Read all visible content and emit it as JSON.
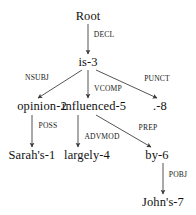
{
  "diagram": {
    "background_color": "#ffffff",
    "line_color": "#555555",
    "text_color": "#111111",
    "sentence": "Sarah's opinion is largely influenced by John's .",
    "nodes": [
      {
        "id": "root",
        "label": "Root",
        "x": 88,
        "y": 16,
        "token_index": null
      },
      {
        "id": "is",
        "label": "is-3",
        "x": 88,
        "y": 62,
        "token_index": 3
      },
      {
        "id": "opinion",
        "label": "opinion-2",
        "x": 42,
        "y": 106,
        "token_index": 2
      },
      {
        "id": "influenced",
        "label": "influenced-5",
        "x": 94,
        "y": 106,
        "token_index": 5
      },
      {
        "id": "punct",
        "label": ".-8",
        "x": 160,
        "y": 106,
        "token_index": 8
      },
      {
        "id": "sarahs",
        "label": "Sarah's-1",
        "x": 32,
        "y": 155,
        "token_index": 1
      },
      {
        "id": "largely",
        "label": "largely-4",
        "x": 87,
        "y": 155,
        "token_index": 4
      },
      {
        "id": "by",
        "label": "by-6",
        "x": 157,
        "y": 155,
        "token_index": 6
      },
      {
        "id": "johns",
        "label": "John's-7",
        "x": 163,
        "y": 202,
        "token_index": 7
      }
    ],
    "edges": [
      {
        "id": "e-decl",
        "label": "DECL",
        "from": "root",
        "to": "is",
        "x1": 88,
        "y1": 24,
        "x2": 88,
        "y2": 54,
        "label_x": 104,
        "label_y": 35
      },
      {
        "id": "e-nsubj",
        "label": "NSUBJ",
        "from": "is",
        "to": "opinion",
        "x1": 82,
        "y1": 70,
        "x2": 38,
        "y2": 98,
        "label_x": 37,
        "label_y": 78
      },
      {
        "id": "e-vcomp",
        "label": "VCOMP",
        "from": "is",
        "to": "influenced",
        "x1": 88,
        "y1": 70,
        "x2": 88,
        "y2": 98,
        "label_x": 108,
        "label_y": 89
      },
      {
        "id": "e-punct",
        "label": "PUNCT",
        "from": "is",
        "to": "punct",
        "x1": 96,
        "y1": 70,
        "x2": 157,
        "y2": 98,
        "label_x": 157,
        "label_y": 79
      },
      {
        "id": "e-poss",
        "label": "POSS",
        "from": "opinion",
        "to": "sarahs",
        "x1": 32,
        "y1": 115,
        "x2": 32,
        "y2": 147,
        "label_x": 48,
        "label_y": 126
      },
      {
        "id": "e-advmod",
        "label": "ADVMOD",
        "from": "influenced",
        "to": "largely",
        "x1": 78,
        "y1": 115,
        "x2": 78,
        "y2": 147,
        "label_x": 102,
        "label_y": 137
      },
      {
        "id": "e-prep",
        "label": "PREP",
        "from": "influenced",
        "to": "by",
        "x1": 96,
        "y1": 115,
        "x2": 151,
        "y2": 147,
        "label_x": 148,
        "label_y": 128
      },
      {
        "id": "e-pobj",
        "label": "POBJ",
        "from": "by",
        "to": "johns",
        "x1": 163,
        "y1": 163,
        "x2": 163,
        "y2": 194,
        "label_x": 178,
        "label_y": 175
      }
    ]
  }
}
